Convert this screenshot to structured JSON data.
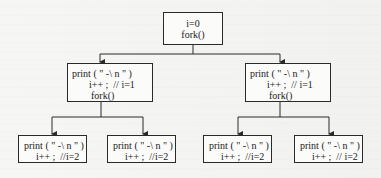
{
  "diagram": {
    "type": "process-fork-tree",
    "root": {
      "lines": [
        "i=0",
        "fork()"
      ]
    },
    "level2": [
      {
        "lines": [
          "print ( \" -\\ n \" )",
          "i++ ;  // i=1",
          "fork()"
        ]
      },
      {
        "lines": [
          "print ( \" -\\ n \" )",
          "i++ ;  // i=1",
          "fork()"
        ]
      }
    ],
    "level3": [
      {
        "lines": [
          "print ( \" -\\ n \" )",
          "i++ ;  //i=2"
        ]
      },
      {
        "lines": [
          "print ( \" -\\ n \" )",
          "i++ ;  //i=2"
        ]
      },
      {
        "lines": [
          "print ( \" -\\ n \" )",
          "i++ ;  //i=2"
        ]
      },
      {
        "lines": [
          "print ( \" -\\ n \" )",
          "i++ ;  // i=2"
        ]
      }
    ],
    "edges": [
      {
        "from": "root",
        "to": "level2.0"
      },
      {
        "from": "root",
        "to": "level2.1"
      },
      {
        "from": "level2.0",
        "to": "level3.0"
      },
      {
        "from": "level2.0",
        "to": "level3.1"
      },
      {
        "from": "level2.1",
        "to": "level3.2"
      },
      {
        "from": "level2.1",
        "to": "level3.3"
      }
    ],
    "colors": {
      "line": "#2a2a2a",
      "box_fill": "#fbfbfa",
      "background": "#f4f4f2"
    }
  }
}
